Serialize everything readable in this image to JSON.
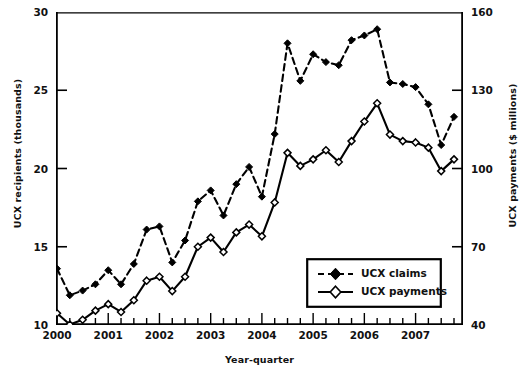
{
  "chart_data": {
    "type": "line",
    "title": "",
    "xlabel": "Year-quarter",
    "ylabel": "UCX recipients (thousands)",
    "ylabel_right": "UCX payments ($ millions)",
    "ylim": [
      10,
      30
    ],
    "ylim_right": [
      40,
      160
    ],
    "yticks": [
      10,
      15,
      20,
      25,
      30
    ],
    "yticks_right": [
      40,
      70,
      100,
      130,
      160
    ],
    "grid": false,
    "legend_position": "lower-right",
    "x": [
      "2000Q1",
      "2000Q2",
      "2000Q3",
      "2000Q4",
      "2001Q1",
      "2001Q2",
      "2001Q3",
      "2001Q4",
      "2002Q1",
      "2002Q2",
      "2002Q3",
      "2002Q4",
      "2003Q1",
      "2003Q2",
      "2003Q3",
      "2003Q4",
      "2004Q1",
      "2004Q2",
      "2004Q3",
      "2004Q4",
      "2005Q1",
      "2005Q2",
      "2005Q3",
      "2005Q4",
      "2006Q1",
      "2006Q2",
      "2006Q3",
      "2006Q4",
      "2007Q1",
      "2007Q2",
      "2007Q3",
      "2007Q4"
    ],
    "xtick_labels": [
      "2000",
      "2001",
      "2002",
      "2003",
      "2004",
      "2005",
      "2006",
      "2007"
    ],
    "xtick_positions": [
      0,
      4,
      8,
      12,
      16,
      20,
      24,
      28
    ],
    "series": [
      {
        "name": "UCX claims",
        "axis": "left",
        "style": "dashed",
        "marker": "filled-diamond",
        "color": "#000000",
        "values": [
          13.6,
          11.9,
          12.2,
          12.6,
          13.5,
          12.6,
          13.9,
          16.1,
          16.3,
          14.0,
          15.4,
          17.9,
          18.6,
          17.0,
          19.0,
          20.1,
          18.2,
          22.2,
          28.0,
          25.6,
          27.3,
          26.8,
          26.6,
          28.2,
          28.5,
          28.9,
          25.5,
          25.4,
          25.2,
          24.1,
          21.5,
          23.3
        ]
      },
      {
        "name": "UCX payments",
        "axis": "right",
        "style": "solid",
        "marker": "open-diamond",
        "color": "#000000",
        "values": [
          44.5,
          40.2,
          42.0,
          45.5,
          48.0,
          45.0,
          49.5,
          57.0,
          58.5,
          53.0,
          58.5,
          70.0,
          73.5,
          68.0,
          75.5,
          78.5,
          74.0,
          87.0,
          106.0,
          101.0,
          103.5,
          107.0,
          102.5,
          110.5,
          118.0,
          125.0,
          113.0,
          110.5,
          110.0,
          108.0,
          99.0,
          103.5
        ]
      }
    ]
  },
  "legend": {
    "items": [
      {
        "label": "UCX claims"
      },
      {
        "label": "UCX payments"
      }
    ]
  }
}
